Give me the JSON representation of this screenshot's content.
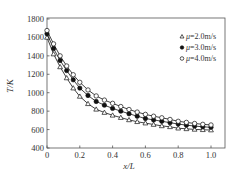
{
  "chart_data": {
    "type": "line",
    "title": "",
    "xlabel": "x/L",
    "ylabel": "T/K",
    "xlim": [
      0,
      1.0
    ],
    "ylim": [
      400,
      1800
    ],
    "xticks": [
      0,
      0.2,
      0.4,
      0.6,
      0.8,
      1.0
    ],
    "xtick_labels": [
      "0",
      "0.2",
      "0.4",
      "0.6",
      "0.8",
      "1.0"
    ],
    "yticks": [
      400,
      600,
      800,
      1000,
      1200,
      1400,
      1600,
      1800
    ],
    "ytick_labels": [
      "400",
      "600",
      "800",
      "1000",
      "1200",
      "1400",
      "1600",
      "1800"
    ],
    "grid": false,
    "legend_position": "upper right",
    "x": [
      0.0,
      0.04,
      0.08,
      0.12,
      0.16,
      0.2,
      0.25,
      0.3,
      0.35,
      0.4,
      0.45,
      0.5,
      0.55,
      0.6,
      0.65,
      0.7,
      0.75,
      0.8,
      0.85,
      0.9,
      0.95,
      1.0
    ],
    "series": [
      {
        "name": "μ=2.0m/s",
        "legend_label": "Δμ=2.0m/s",
        "marker": "triangle-open",
        "values": [
          1600,
          1420,
          1280,
          1160,
          1050,
          960,
          880,
          820,
          785,
          755,
          730,
          705,
          685,
          670,
          655,
          640,
          630,
          615,
          608,
          602,
          598,
          595
        ]
      },
      {
        "name": "μ=3.0m/s",
        "legend_label": "●μ=3.0m/s",
        "marker": "circle-filled",
        "values": [
          1640,
          1480,
          1350,
          1240,
          1140,
          1050,
          970,
          905,
          865,
          830,
          800,
          772,
          745,
          720,
          705,
          690,
          675,
          660,
          648,
          638,
          630,
          625
        ]
      },
      {
        "name": "μ=4.0m/s",
        "legend_label": "○μ=4.0m/s",
        "marker": "circle-open",
        "values": [
          1675,
          1530,
          1400,
          1290,
          1195,
          1113,
          1030,
          965,
          920,
          885,
          850,
          818,
          790,
          765,
          745,
          728,
          710,
          690,
          678,
          666,
          657,
          650
        ]
      }
    ]
  },
  "legend": {
    "items": [
      {
        "symbol": "△",
        "label": "μ=2.0m/s"
      },
      {
        "symbol": "●",
        "label": "μ=3.0m/s"
      },
      {
        "symbol": "○",
        "label": "μ=4.0m/s"
      }
    ]
  },
  "colors": {
    "line": "#111111",
    "frame": "#555555",
    "marker_fill_open": "#ffffff",
    "marker_fill_solid": "#111111"
  }
}
